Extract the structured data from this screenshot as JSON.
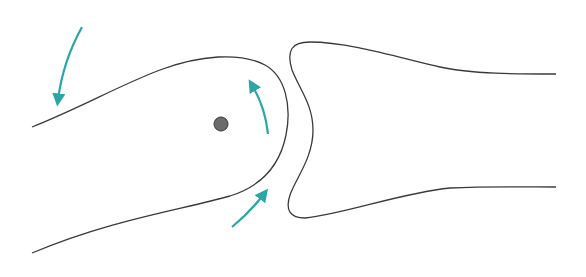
{
  "diagram": {
    "title": "",
    "colors": {
      "background": "#ffffff",
      "outline": "#3a3a3a",
      "arrow": "#2aa6a6",
      "pivot_fill": "#6b6b6b",
      "pivot_stroke": "#3a3a3a"
    },
    "elements": [
      {
        "id": "left-bone",
        "type": "outline",
        "description": "rounded bone end (convex head) pointing right"
      },
      {
        "id": "right-bone",
        "type": "outline",
        "description": "concave socket bone end opening left"
      },
      {
        "id": "pivot",
        "type": "dot",
        "description": "axis of rotation inside left bone head"
      },
      {
        "id": "arrow-top-left",
        "type": "arrow",
        "direction": "downward curve"
      },
      {
        "id": "arrow-inner-head",
        "type": "arrow",
        "direction": "upward along joint surface"
      },
      {
        "id": "arrow-bottom",
        "type": "arrow",
        "direction": "up-right toward joint"
      }
    ]
  }
}
